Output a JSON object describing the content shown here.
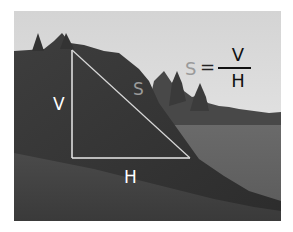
{
  "figure": {
    "labels": {
      "vertical": "V",
      "horizontal": "H",
      "slope": "S"
    },
    "formula": {
      "lhs": "S",
      "equals": "=",
      "numerator": "V",
      "denominator": "H"
    },
    "colors": {
      "overlay_line": "#e8e8e8",
      "label_text": "#ffffff",
      "formula_text": "#111111",
      "formula_s": "#9a9a9a"
    }
  }
}
